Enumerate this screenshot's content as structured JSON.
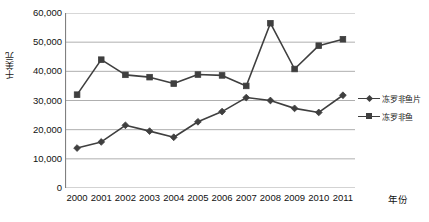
{
  "chart_data": {
    "type": "line",
    "title": "",
    "xlabel": "年份",
    "ylabel": "千美元",
    "categories": [
      "2000",
      "2001",
      "2002",
      "2003",
      "2004",
      "2005",
      "2006",
      "2007",
      "2008",
      "2009",
      "2010",
      "2011"
    ],
    "ylim": [
      0,
      60000
    ],
    "ytick_step": 10000,
    "ytick_labels": [
      "60,000",
      "50,000",
      "40,000",
      "30,000",
      "20,000",
      "10,000",
      "0"
    ],
    "ytick_values": [
      60000,
      50000,
      40000,
      30000,
      20000,
      10000,
      0
    ],
    "grid": true,
    "legend_position": "right",
    "series": [
      {
        "name": "冻罗非鱼片",
        "marker": "diamond",
        "color": "#3f3f3f",
        "values": [
          13700,
          15800,
          21500,
          19500,
          17400,
          22700,
          26200,
          31000,
          30000,
          27300,
          25900,
          31800
        ]
      },
      {
        "name": "冻罗非鱼",
        "marker": "square",
        "color": "#3f3f3f",
        "values": [
          32000,
          44000,
          38800,
          38000,
          35800,
          38900,
          38600,
          35000,
          56500,
          40800,
          48800,
          51000
        ]
      }
    ]
  },
  "axis": {
    "y_title": "千美元",
    "x_title": "年份"
  },
  "colors": {
    "series": "#3f3f3f",
    "grid": "#a6a6a6",
    "axis": "#808080",
    "text": "#111111",
    "background": "#ffffff"
  }
}
